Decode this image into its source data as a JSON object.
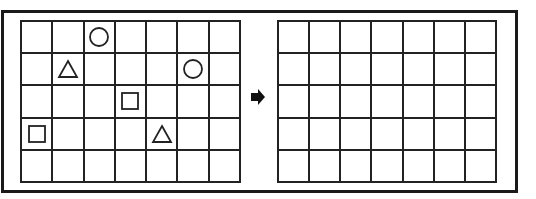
{
  "puzzle": {
    "rows": 5,
    "cols": 7,
    "left_grid": {
      "shapes": [
        {
          "row": 0,
          "col": 2,
          "shape": "circle"
        },
        {
          "row": 1,
          "col": 1,
          "shape": "triangle"
        },
        {
          "row": 1,
          "col": 5,
          "shape": "circle"
        },
        {
          "row": 2,
          "col": 3,
          "shape": "square"
        },
        {
          "row": 3,
          "col": 0,
          "shape": "square"
        },
        {
          "row": 3,
          "col": 4,
          "shape": "triangle"
        }
      ]
    },
    "right_grid": {
      "shapes": []
    },
    "arrow": {
      "icon": "arrow-right-icon",
      "direction": "right"
    },
    "colors": {
      "line": "#222222",
      "background": "#ffffff",
      "arrow": "#111111"
    }
  }
}
